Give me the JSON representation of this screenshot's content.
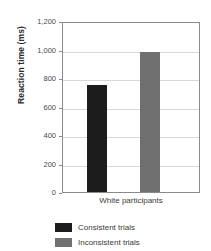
{
  "chart_data": {
    "type": "bar",
    "title": "",
    "xlabel": "",
    "ylabel": "Reaction time (ms)",
    "categories": [
      "White participants"
    ],
    "series": [
      {
        "name": "Consistent trials",
        "values": [
          750
        ],
        "color": "#1c1c1c"
      },
      {
        "name": "Inconsistent trials",
        "values": [
          980
        ],
        "color": "#707070"
      }
    ],
    "ylim": [
      0,
      1200
    ],
    "ytick_values": [
      1200,
      1000,
      800,
      600,
      400,
      200,
      0
    ],
    "ytick_labels": [
      "1,200",
      "1,000",
      "800",
      "600",
      "400",
      "200",
      "0"
    ],
    "grid": "horizontal",
    "legend_position": "bottom-left"
  },
  "axis": {
    "y_title": "Reaction time (ms)",
    "ticks": [
      {
        "label": "1,200",
        "value": 1200
      },
      {
        "label": "1,000",
        "value": 1000
      },
      {
        "label": "800",
        "value": 800
      },
      {
        "label": "600",
        "value": 600
      },
      {
        "label": "400",
        "value": 400
      },
      {
        "label": "200",
        "value": 200
      },
      {
        "label": "0",
        "value": 0
      }
    ],
    "category_label": "White participants"
  },
  "bars": [
    {
      "name": "consistent",
      "label": "Consistent trials",
      "value": 750,
      "color": "#1c1c1c"
    },
    {
      "name": "inconsistent",
      "label": "Inconsistent trials",
      "value": 980,
      "color": "#707070"
    }
  ],
  "legend": {
    "items": [
      {
        "label": "Consistent trials",
        "color": "#1c1c1c"
      },
      {
        "label": "Inconsistent trials",
        "color": "#707070"
      }
    ]
  }
}
